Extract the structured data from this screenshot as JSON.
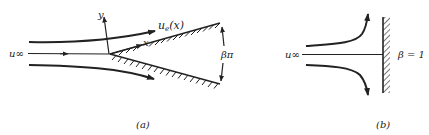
{
  "figure": {
    "panel_a": {
      "caption": "(a)",
      "freestream_label": "u∞",
      "y_axis_label": "y",
      "x_axis_label": "x",
      "edge_velocity_label": "u",
      "edge_velocity_subscript": "e",
      "edge_velocity_arg": "(x)",
      "wedge_angle_label": "βπ",
      "description": "Flow past a wedge of included angle βπ"
    },
    "panel_b": {
      "caption": "(b)",
      "freestream_label": "u∞",
      "beta_label": "β = 1",
      "description": "Stagnation-point flow against a flat wall"
    },
    "colors": {
      "ink": "#222222",
      "background": "#ffffff"
    }
  }
}
